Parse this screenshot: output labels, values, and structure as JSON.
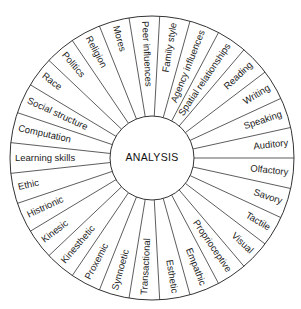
{
  "center": {
    "label": "ANALYSIS"
  },
  "geometry": {
    "cx": 152,
    "cy": 158,
    "outer_r": 142,
    "inner_r": 42,
    "start_angle_deg": -90
  },
  "segments": [
    "Peer influences",
    "Family style",
    "Agency influences",
    "Spatial relationships",
    "Reading",
    "Writing",
    "Speaking",
    "Auditory",
    "Olfactory",
    "Savory",
    "Tactile",
    "Visual",
    "Proprioceptive",
    "Empathic",
    "Esthetic",
    "Transactional",
    "Synnoetic",
    "Proxemic",
    "Kinesthetic",
    "Kinesic",
    "Histrionic",
    "Ethic",
    "Learning skills",
    "Computation",
    "Social structure",
    "Race",
    "Politics",
    "Religion",
    "Mores"
  ],
  "colors": {
    "line": "#333333",
    "text": "#222222",
    "background": "#ffffff"
  }
}
